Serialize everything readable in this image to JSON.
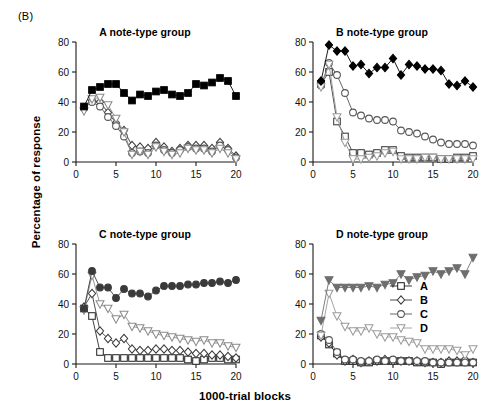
{
  "figure": {
    "panel_label": "(B)",
    "xlabel": "1000-trial blocks",
    "ylabel": "Percentage of response"
  },
  "legend": {
    "entries": [
      {
        "label": "A",
        "marker": "square"
      },
      {
        "label": "B",
        "marker": "diamond"
      },
      {
        "label": "C",
        "marker": "circle"
      },
      {
        "label": "D",
        "marker": "triangle-down"
      }
    ]
  },
  "chart_data": [
    {
      "type": "line",
      "title": "A note-type group",
      "xlabel": "1000-trial blocks",
      "ylabel": "Percentage of response",
      "xlim": [
        0,
        20
      ],
      "ylim": [
        0,
        80
      ],
      "xticks": [
        0,
        5,
        10,
        15,
        20
      ],
      "yticks": [
        0,
        20,
        40,
        60,
        80
      ],
      "grid": false,
      "legend_position": "none",
      "x": [
        1,
        2,
        3,
        4,
        5,
        6,
        7,
        8,
        9,
        10,
        11,
        12,
        13,
        14,
        15,
        16,
        17,
        18,
        19,
        20
      ],
      "series": [
        {
          "name": "A",
          "marker": "square",
          "filled": true,
          "color": "#000000",
          "values": [
            37,
            48,
            50,
            52,
            52,
            46,
            41,
            45,
            44,
            47,
            48,
            45,
            44,
            46,
            52,
            51,
            53,
            56,
            54,
            44
          ]
        },
        {
          "name": "B",
          "marker": "diamond",
          "filled": false,
          "color": "#3b3b3b",
          "values": [
            36,
            41,
            40,
            33,
            26,
            21,
            11,
            10,
            9,
            13,
            10,
            7,
            9,
            11,
            11,
            11,
            9,
            13,
            9,
            4
          ]
        },
        {
          "name": "C",
          "marker": "circle",
          "filled": false,
          "color": "#555555",
          "values": [
            36,
            40,
            37,
            30,
            24,
            17,
            6,
            7,
            6,
            11,
            8,
            6,
            8,
            10,
            9,
            9,
            7,
            11,
            8,
            3
          ]
        },
        {
          "name": "D",
          "marker": "triangle-down",
          "filled": false,
          "color": "#8a8a8a",
          "values": [
            34,
            42,
            43,
            38,
            29,
            20,
            5,
            7,
            5,
            10,
            7,
            5,
            6,
            9,
            8,
            8,
            6,
            9,
            6,
            2
          ]
        }
      ]
    },
    {
      "type": "line",
      "title": "B note-type group",
      "xlabel": "1000-trial blocks",
      "ylabel": "Percentage of response",
      "xlim": [
        0,
        20
      ],
      "ylim": [
        0,
        80
      ],
      "xticks": [
        0,
        5,
        10,
        15,
        20
      ],
      "yticks": [
        0,
        20,
        40,
        60,
        80
      ],
      "grid": false,
      "legend_position": "none",
      "x": [
        1,
        2,
        3,
        4,
        5,
        6,
        7,
        8,
        9,
        10,
        11,
        12,
        13,
        14,
        15,
        16,
        17,
        18,
        19,
        20
      ],
      "series": [
        {
          "name": "A",
          "marker": "square",
          "filled": false,
          "color": "#3b3b3b",
          "values": [
            52,
            60,
            27,
            17,
            6,
            6,
            5,
            6,
            8,
            8,
            4,
            3,
            3,
            3,
            3,
            2,
            2,
            3,
            3,
            4
          ]
        },
        {
          "name": "B",
          "marker": "diamond",
          "filled": true,
          "color": "#000000",
          "values": [
            54,
            78,
            74,
            74,
            64,
            65,
            59,
            63,
            63,
            69,
            58,
            65,
            64,
            62,
            62,
            61,
            52,
            51,
            54,
            50
          ]
        },
        {
          "name": "C",
          "marker": "circle",
          "filled": false,
          "color": "#555555",
          "values": [
            51,
            66,
            58,
            46,
            33,
            31,
            29,
            28,
            28,
            27,
            21,
            20,
            19,
            17,
            15,
            13,
            12,
            12,
            12,
            11
          ]
        },
        {
          "name": "D",
          "marker": "triangle-down",
          "filled": false,
          "color": "#9a9a9a",
          "values": [
            50,
            65,
            30,
            13,
            2,
            2,
            3,
            4,
            6,
            7,
            2,
            2,
            2,
            3,
            3,
            2,
            2,
            2,
            2,
            2
          ]
        }
      ]
    },
    {
      "type": "line",
      "title": "C note-type group",
      "xlabel": "1000-trial blocks",
      "ylabel": "Percentage of response",
      "xlim": [
        0,
        20
      ],
      "ylim": [
        0,
        80
      ],
      "xticks": [
        0,
        5,
        10,
        15,
        20
      ],
      "yticks": [
        0,
        20,
        40,
        60,
        80
      ],
      "grid": false,
      "legend_position": "none",
      "x": [
        1,
        2,
        3,
        4,
        5,
        6,
        7,
        8,
        9,
        10,
        11,
        12,
        13,
        14,
        15,
        16,
        17,
        18,
        19,
        20
      ],
      "series": [
        {
          "name": "A",
          "marker": "square",
          "filled": false,
          "color": "#2b2b2b",
          "values": [
            37,
            32,
            8,
            4,
            4,
            4,
            4,
            4,
            4,
            4,
            4,
            4,
            4,
            3,
            2,
            3,
            4,
            4,
            3,
            3
          ]
        },
        {
          "name": "B",
          "marker": "diamond",
          "filled": false,
          "color": "#3b3b3b",
          "values": [
            38,
            47,
            22,
            17,
            14,
            17,
            10,
            9,
            9,
            10,
            10,
            9,
            9,
            8,
            7,
            7,
            6,
            6,
            5,
            4
          ]
        },
        {
          "name": "C",
          "marker": "circle",
          "filled": true,
          "color": "#3a3a3a",
          "values": [
            37,
            62,
            51,
            51,
            44,
            50,
            47,
            47,
            45,
            49,
            52,
            52,
            52,
            53,
            53,
            54,
            54,
            55,
            54,
            56
          ]
        },
        {
          "name": "D",
          "marker": "triangle-down",
          "filled": false,
          "color": "#8a8a8a",
          "values": [
            36,
            59,
            40,
            37,
            30,
            33,
            25,
            24,
            22,
            20,
            19,
            18,
            17,
            16,
            15,
            16,
            14,
            14,
            12,
            11
          ]
        }
      ]
    },
    {
      "type": "line",
      "title": "D note-type group",
      "xlabel": "1000-trial blocks",
      "ylabel": "Percentage of response",
      "xlim": [
        0,
        20
      ],
      "ylim": [
        0,
        80
      ],
      "xticks": [
        0,
        5,
        10,
        15,
        20
      ],
      "yticks": [
        0,
        20,
        40,
        60,
        80
      ],
      "grid": false,
      "legend_position": "inside-right",
      "x": [
        1,
        2,
        3,
        4,
        5,
        6,
        7,
        8,
        9,
        10,
        11,
        12,
        13,
        14,
        15,
        16,
        17,
        18,
        19,
        20
      ],
      "series": [
        {
          "name": "A",
          "marker": "square",
          "filled": false,
          "color": "#1f1f1f",
          "values": [
            19,
            13,
            7,
            2,
            2,
            1,
            1,
            2,
            2,
            2,
            2,
            2,
            1,
            1,
            1,
            0,
            1,
            1,
            1,
            1
          ]
        },
        {
          "name": "B",
          "marker": "diamond",
          "filled": false,
          "color": "#3b3b3b",
          "values": [
            18,
            14,
            6,
            2,
            3,
            1,
            2,
            2,
            3,
            2,
            2,
            2,
            2,
            1,
            1,
            1,
            2,
            2,
            3,
            1
          ]
        },
        {
          "name": "C",
          "marker": "circle",
          "filled": false,
          "color": "#555555",
          "values": [
            20,
            16,
            8,
            3,
            3,
            2,
            2,
            3,
            2,
            3,
            2,
            2,
            2,
            2,
            1,
            1,
            1,
            1,
            1,
            1
          ]
        },
        {
          "name": "D",
          "marker": "triangle-down",
          "filled": false,
          "color": "#9a9a9a",
          "values": [
            19,
            47,
            32,
            25,
            22,
            22,
            24,
            20,
            18,
            18,
            16,
            15,
            14,
            10,
            10,
            10,
            10,
            9,
            6,
            10
          ]
        }
      ]
    },
    {
      "type": "line",
      "title": "D note-type group (filled series)",
      "note": "solid triangle series overlay in panel D",
      "xlim": [
        0,
        20
      ],
      "ylim": [
        0,
        80
      ],
      "x": [
        1,
        2,
        3,
        4,
        5,
        6,
        7,
        8,
        9,
        10,
        11,
        12,
        13,
        14,
        15,
        16,
        17,
        18,
        19,
        20
      ],
      "series": [
        {
          "name": "D-solid",
          "marker": "triangle-down",
          "filled": true,
          "color": "#6e6e6e",
          "values": [
            29,
            56,
            51,
            51,
            51,
            51,
            52,
            51,
            53,
            54,
            60,
            56,
            58,
            59,
            62,
            60,
            62,
            64,
            60,
            71
          ]
        }
      ]
    }
  ]
}
